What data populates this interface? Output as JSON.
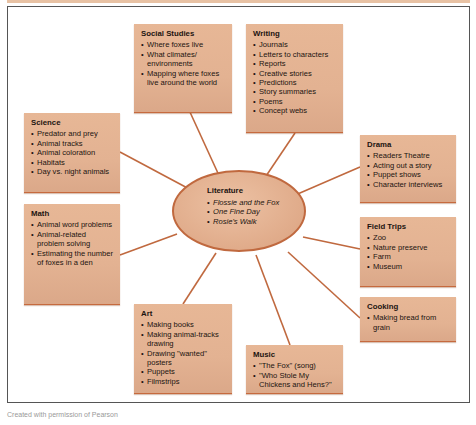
{
  "colors": {
    "box_fill": "#e3b292",
    "connector": "#c0693f",
    "frame_border": "#555555"
  },
  "center": {
    "title": "Literature",
    "items": [
      "Flossie and the Fox",
      "One Fine Day",
      "Rosie's Walk"
    ]
  },
  "branches": {
    "social_studies": {
      "title": "Social Studies",
      "items": [
        "Where foxes live",
        "What climates/ environments",
        "Mapping where foxes live around the world"
      ]
    },
    "writing": {
      "title": "Writing",
      "items": [
        "Journals",
        "Letters to characters",
        "Reports",
        "Creative stories",
        "Predictions",
        "Story summaries",
        "Poems",
        "Concept webs"
      ]
    },
    "science": {
      "title": "Science",
      "items": [
        "Predator and prey",
        "Animal tracks",
        "Animal coloration",
        "Habitats",
        "Day vs. night animals"
      ]
    },
    "drama": {
      "title": "Drama",
      "items": [
        "Readers Theatre",
        "Acting out a story",
        "Puppet shows",
        "Character interviews"
      ]
    },
    "math": {
      "title": "Math",
      "items": [
        "Animal word problems",
        "Animal-related problem solving",
        "Estimating the number of foxes in a den"
      ]
    },
    "field_trips": {
      "title": "Field Trips",
      "items": [
        "Zoo",
        "Nature preserve",
        "Farm",
        "Museum"
      ]
    },
    "cooking": {
      "title": "Cooking",
      "items": [
        "Making bread from grain"
      ]
    },
    "art": {
      "title": "Art",
      "items": [
        "Making books",
        "Making animal-tracks drawing",
        "Drawing \"wanted\" posters",
        "Puppets",
        "Filmstrips"
      ]
    },
    "music": {
      "title": "Music",
      "items": [
        "\"The Fox\" (song)",
        "\"Who Stole My Chickens and Hens?\""
      ]
    }
  },
  "caption": "Created with permission of Pearson"
}
